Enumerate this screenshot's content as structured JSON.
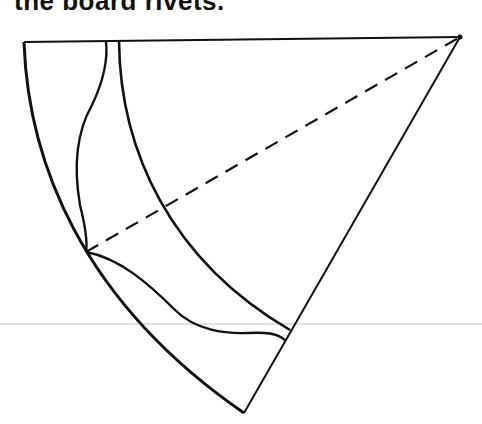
{
  "caption": {
    "text": "the board rivets."
  },
  "diagram": {
    "stroke_color": "#111111",
    "rule_color": "#d0d0d0",
    "points": {
      "apex": [
        460,
        37
      ],
      "top_left": [
        24,
        42
      ],
      "bottom_tip": [
        244,
        413
      ],
      "left_junction": [
        85,
        252
      ]
    }
  }
}
